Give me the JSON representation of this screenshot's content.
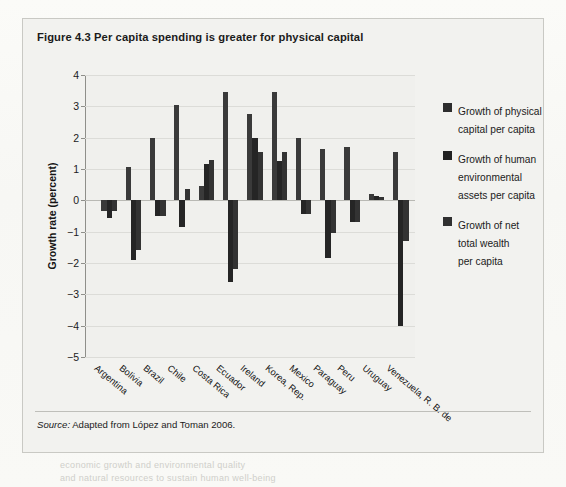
{
  "figure": {
    "title": "Figure 4.3  Per capita spending is greater for physical capital",
    "source_label": "Source:",
    "source_text": " Adapted from López and Toman 2006."
  },
  "legend": {
    "position": "right",
    "items": [
      {
        "label": "Growth of physical\ncapital per capita",
        "color": "#2d2d2d",
        "swatch_name": "legend-swatch-physical-capital"
      },
      {
        "label": "Growth of human\nenvironmental\nassets per capita",
        "color": "#222222",
        "swatch_name": "legend-swatch-human-environmental"
      },
      {
        "label": "Growth of net\ntotal wealth\nper capita",
        "color": "#303030",
        "swatch_name": "legend-swatch-net-total-wealth"
      }
    ]
  },
  "chart_data": {
    "type": "bar",
    "title": "Per capita spending is greater for physical capital",
    "xlabel": "",
    "ylabel": "Growth rate (percent)",
    "ylim": [
      -5,
      4
    ],
    "yticks": [
      4,
      3,
      2,
      1,
      0,
      -1,
      -2,
      -3,
      -4,
      -5
    ],
    "ytick_labels": [
      "4",
      "3",
      "2",
      "1",
      "0",
      "−1",
      "−2",
      "−3",
      "−4",
      "−5"
    ],
    "grid": true,
    "grid_axis": "y",
    "legend_position": "right",
    "categories": [
      "Argentina",
      "Bolivia",
      "Brazil",
      "Chile",
      "Costa Rica",
      "Ecuador",
      "Ireland",
      "Korea, Rep.",
      "Mexico",
      "Paraguay",
      "Peru",
      "Uruguay",
      "Venezuela, R. B. de"
    ],
    "series": [
      {
        "name": "Growth of physical capital per capita",
        "color": "#3a3a3a",
        "values": [
          -0.35,
          1.05,
          2.0,
          3.05,
          0.45,
          3.45,
          2.75,
          3.45,
          2.0,
          1.65,
          1.7,
          0.2,
          1.55
        ]
      },
      {
        "name": "Growth of human environmental assets per capita",
        "color": "#252525",
        "values": [
          -0.55,
          -1.9,
          -0.5,
          -0.85,
          1.15,
          -2.6,
          2.0,
          1.25,
          -0.45,
          -1.85,
          -0.7,
          0.15,
          -4.0
        ]
      },
      {
        "name": "Growth of net total wealth per capita",
        "color": "#333333",
        "values": [
          -0.35,
          -1.6,
          -0.5,
          0.35,
          1.3,
          -2.2,
          1.55,
          1.55,
          -0.45,
          -1.05,
          -0.7,
          0.1,
          -1.3
        ]
      }
    ]
  },
  "bleed": {
    "lines": [
      {
        "text": "Venezuela, R. B. de",
        "x": 452,
        "y": 30
      },
      {
        "text": "Uruguay",
        "x": 452,
        "y": 44
      },
      {
        "text": "to diagnose policies and priorities",
        "x": 185,
        "y": 278
      },
      {
        "text": "economic growth and environmental quality",
        "x": 60,
        "y": 460
      },
      {
        "text": "and natural resources to sustain human well-being",
        "x": 60,
        "y": 473
      }
    ]
  }
}
